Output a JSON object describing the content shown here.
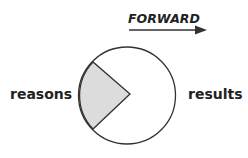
{
  "direction_label": "FORWARD",
  "left_label": "reasons",
  "right_label": "results",
  "colors": {
    "stroke": "#333333",
    "sector_fill": "#dcdcdc",
    "circle_fill": "#ffffff",
    "text": "#222222"
  }
}
